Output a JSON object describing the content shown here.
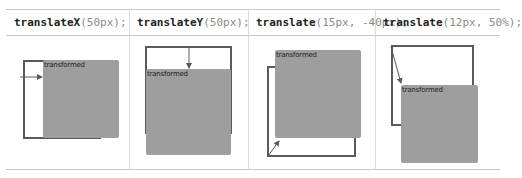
{
  "columns": [
    {
      "fn": "translateX",
      "args": "(50px);",
      "box_label": "transformed"
    },
    {
      "fn": "translateY",
      "args": "(50px);",
      "box_label": "transformed"
    },
    {
      "fn": "translate",
      "args": "(15px, -40px);",
      "box_label": "transformed"
    },
    {
      "fn": "translate",
      "args": "(12px, 50%);",
      "box_label": "transformed"
    }
  ],
  "colors": {
    "box_fill": "#9e9e9e",
    "outline": "#5a5a5a",
    "arrow": "#5a5a5a",
    "grid": "#c8c8c8"
  }
}
